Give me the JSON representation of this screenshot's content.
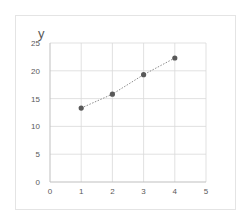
{
  "chart_data": {
    "type": "scatter",
    "title": "",
    "xlabel": "",
    "ylabel": "y",
    "x": [
      1,
      2,
      3,
      4
    ],
    "series": [
      {
        "name": "y",
        "values": [
          13.3,
          15.8,
          19.3,
          22.3
        ],
        "marker": "circle",
        "line": "dotted"
      }
    ],
    "xlim": [
      0,
      5
    ],
    "ylim": [
      0,
      25
    ],
    "xticks": [
      "0",
      "1",
      "2",
      "3",
      "4",
      "5"
    ],
    "yticks": [
      "0",
      "5",
      "10",
      "15",
      "20",
      "25"
    ],
    "grid": true,
    "legend": false
  },
  "colors": {
    "marker": "#595959",
    "line": "#8c8c8c",
    "grid": "#d9d9d9",
    "tick_text": "#595959"
  }
}
